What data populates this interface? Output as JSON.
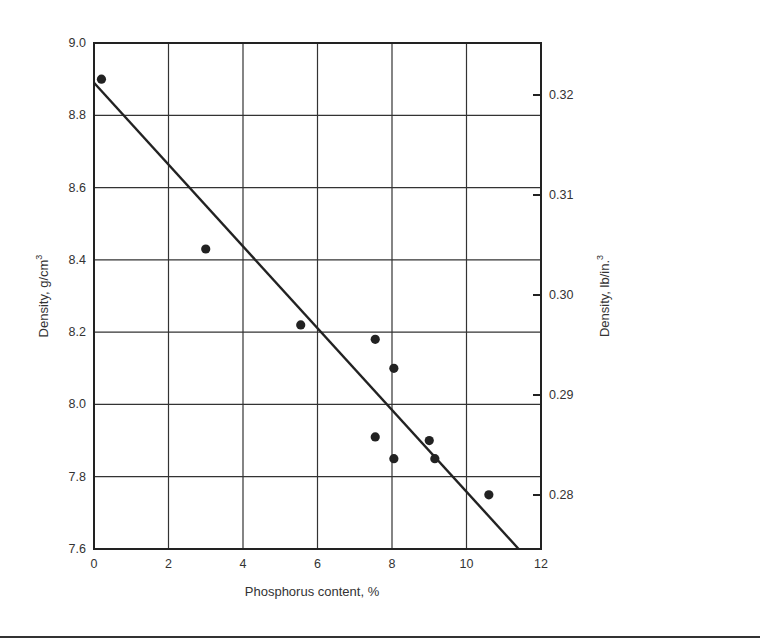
{
  "chart_data": {
    "type": "scatter",
    "title": "",
    "xlabel": "Phosphorus content, %",
    "ylabel": "Density, g/cm³",
    "ylabel_base": "Density, g/cm",
    "ylabel_sup": "3",
    "y2label": "Density, lb/in.³",
    "y2label_base": "Density, lb/in.",
    "y2label_sup": "3",
    "xlim": [
      0,
      12
    ],
    "ylim": [
      7.6,
      9.0
    ],
    "y2lim": [
      0.2746,
      0.3252
    ],
    "grid": true,
    "legend": "none",
    "x_ticks": [
      0,
      2,
      4,
      6,
      8,
      10,
      12
    ],
    "x_tick_labels": [
      "0",
      "2",
      "4",
      "6",
      "8",
      "10",
      "12"
    ],
    "y_ticks": [
      7.6,
      7.8,
      8.0,
      8.2,
      8.4,
      8.6,
      8.8,
      9.0
    ],
    "y_tick_labels": [
      "7.6",
      "7.8",
      "8.0",
      "8.2",
      "8.4",
      "8.6",
      "8.8",
      "9.0"
    ],
    "y2_ticks": [
      0.28,
      0.29,
      0.3,
      0.31,
      0.32
    ],
    "y2_tick_labels": [
      "0.28",
      "0.29",
      "0.30",
      "0.31",
      "0.32"
    ],
    "series": [
      {
        "name": "Measured density",
        "kind": "points",
        "color": "#222222",
        "points": [
          {
            "x": 0.2,
            "y": 8.9
          },
          {
            "x": 3.0,
            "y": 8.43
          },
          {
            "x": 5.55,
            "y": 8.22
          },
          {
            "x": 7.55,
            "y": 8.18
          },
          {
            "x": 8.05,
            "y": 8.1
          },
          {
            "x": 7.55,
            "y": 7.91
          },
          {
            "x": 8.05,
            "y": 7.85
          },
          {
            "x": 9.0,
            "y": 7.9
          },
          {
            "x": 9.15,
            "y": 7.85
          },
          {
            "x": 10.6,
            "y": 7.75
          }
        ]
      },
      {
        "name": "Fit line",
        "kind": "line",
        "color": "#222222",
        "points": [
          {
            "x": 0.0,
            "y": 8.89
          },
          {
            "x": 11.4,
            "y": 7.6
          }
        ]
      }
    ]
  }
}
